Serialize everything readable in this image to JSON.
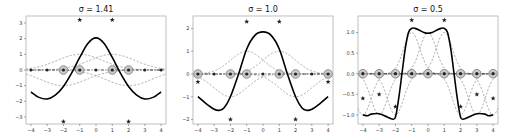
{
  "figure": {
    "width": 513,
    "height": 139,
    "colors": {
      "solid_curve": "#000000",
      "dashed_kernel": "#8c8c8c",
      "zero_line": "#444444",
      "circle_marker_fill": "#bdbdbd",
      "circle_marker_edge": "#7a7a7a",
      "star": "#222222",
      "axes_edge": "#b0b0b0"
    }
  },
  "chart_data": [
    {
      "type": "line",
      "title": "σ = 1.41",
      "sigma": 1.41,
      "xlabel": "",
      "ylabel": "",
      "xlim": [
        -4.3,
        4.3
      ],
      "ylim": [
        -3.45,
        3.45
      ],
      "xticks": [
        -4,
        -3,
        -2,
        -1,
        0,
        1,
        2,
        3,
        4
      ],
      "yticks": [
        -3,
        -2,
        -1,
        0,
        1,
        2,
        3
      ],
      "ytick_labels": [
        "−3",
        "−2",
        "−1",
        "0",
        "1",
        "2",
        "3"
      ],
      "kernel_centers": [
        -2,
        -1,
        1,
        2
      ],
      "kernel_signs": [
        -1,
        1,
        1,
        -1
      ],
      "solid_curve": {
        "x": [
          -4,
          -3.5,
          -3,
          -2.5,
          -2,
          -1.5,
          -1,
          -0.5,
          0,
          0.5,
          1,
          1.5,
          2,
          2.5,
          3,
          3.5,
          4
        ],
        "y": [
          -1.4,
          -1.75,
          -1.85,
          -1.6,
          -1.05,
          -0.2,
          0.8,
          1.7,
          2.05,
          1.7,
          0.8,
          -0.2,
          -1.05,
          -1.6,
          -1.85,
          -1.75,
          -1.4
        ]
      },
      "stars": [
        {
          "x": -1,
          "y": 3.2
        },
        {
          "x": 1,
          "y": 3.2
        },
        {
          "x": -2,
          "y": -3.3
        },
        {
          "x": 2,
          "y": -3.3
        }
      ],
      "circled_points_x": [
        -2,
        -1,
        1,
        2
      ],
      "dot_points_x": [
        -4,
        -3,
        0,
        3,
        4
      ]
    },
    {
      "type": "line",
      "title": "σ = 1.0",
      "sigma": 1.0,
      "xlabel": "",
      "ylabel": "",
      "xlim": [
        -4.3,
        4.3
      ],
      "ylim": [
        -2.2,
        2.55
      ],
      "xticks": [
        -4,
        -3,
        -2,
        -1,
        0,
        1,
        2,
        3,
        4
      ],
      "yticks": [
        -2,
        -1,
        0,
        1,
        2
      ],
      "ytick_labels": [
        "−2",
        "−1",
        "0",
        "1",
        "2"
      ],
      "kernel_centers": [
        -2,
        -1,
        1,
        2
      ],
      "kernel_signs": [
        -1,
        1,
        1,
        -1
      ],
      "solid_curve": {
        "x": [
          -4,
          -3.5,
          -3,
          -2.7,
          -2.4,
          -2,
          -1.5,
          -1,
          -0.5,
          0,
          0.5,
          1,
          1.5,
          2,
          2.4,
          2.7,
          3,
          3.5,
          4
        ],
        "y": [
          -1.0,
          -1.3,
          -1.55,
          -1.6,
          -1.5,
          -1.0,
          0.0,
          1.1,
          1.7,
          1.85,
          1.7,
          1.1,
          0.0,
          -1.0,
          -1.5,
          -1.6,
          -1.55,
          -1.3,
          -1.0
        ]
      },
      "stars": [
        {
          "x": -1,
          "y": 2.3
        },
        {
          "x": 1,
          "y": 2.3
        },
        {
          "x": -2,
          "y": -2.0
        },
        {
          "x": 2,
          "y": -2.0
        },
        {
          "x": -4,
          "y": -0.35
        },
        {
          "x": 4,
          "y": -0.35
        }
      ],
      "circled_points_x": [
        -4,
        -2,
        -1,
        1,
        2,
        4
      ],
      "dot_points_x": [
        -3,
        0,
        3
      ]
    },
    {
      "type": "line",
      "title": "σ = 0.5",
      "sigma": 0.5,
      "xlabel": "",
      "ylabel": "",
      "xlim": [
        -4.3,
        4.3
      ],
      "ylim": [
        -1.22,
        1.4
      ],
      "xticks": [
        -4,
        -3,
        -2,
        -1,
        0,
        1,
        2,
        3,
        4
      ],
      "yticks": [
        -1.0,
        -0.5,
        0.0,
        0.5,
        1.0
      ],
      "ytick_labels": [
        "−1.0",
        "−0.5",
        "0.0",
        "0.5",
        "1.0"
      ],
      "kernel_centers": [
        -4,
        -3,
        -2,
        -1,
        0,
        1,
        2,
        3,
        4
      ],
      "kernel_signs": [
        -1,
        -1,
        -1,
        1,
        1,
        1,
        -1,
        -1,
        -1
      ],
      "solid_curve": {
        "x": [
          -4,
          -3.7,
          -3.5,
          -3,
          -2.5,
          -2.2,
          -2,
          -1.8,
          -1.6,
          -1.4,
          -1.2,
          -1,
          -0.8,
          -0.5,
          -0.25,
          0,
          0.25,
          0.5,
          0.8,
          1,
          1.2,
          1.4,
          1.6,
          1.8,
          2,
          2.2,
          2.5,
          3,
          3.5,
          3.7,
          4
        ],
        "y": [
          -1.0,
          -1.02,
          -0.98,
          -0.97,
          -1.05,
          -1.1,
          -1.05,
          -0.6,
          0.0,
          0.6,
          1.0,
          1.1,
          1.1,
          1.05,
          1.0,
          0.98,
          1.0,
          1.05,
          1.1,
          1.1,
          1.0,
          0.6,
          0.0,
          -0.6,
          -1.05,
          -1.1,
          -1.05,
          -0.97,
          -0.98,
          -1.02,
          -1.0
        ]
      },
      "stars": [
        {
          "x": -1,
          "y": 1.3
        },
        {
          "x": 1,
          "y": 1.3
        },
        {
          "x": -4,
          "y": -0.6
        },
        {
          "x": 4,
          "y": -0.6
        },
        {
          "x": -3,
          "y": -0.5
        },
        {
          "x": 3,
          "y": -0.5
        },
        {
          "x": -2,
          "y": -0.8
        },
        {
          "x": 2,
          "y": -0.8
        }
      ],
      "circled_points_x": [
        -4,
        -3,
        -2,
        -1,
        0,
        1,
        2,
        3,
        4
      ],
      "dot_points_x": []
    }
  ],
  "panels": [
    {
      "box": {
        "left": 26,
        "top": 16,
        "right": 166,
        "bottom": 124
      }
    },
    {
      "box": {
        "left": 193,
        "top": 16,
        "right": 333,
        "bottom": 124
      }
    },
    {
      "box": {
        "left": 358,
        "top": 16,
        "right": 498,
        "bottom": 124
      }
    }
  ]
}
